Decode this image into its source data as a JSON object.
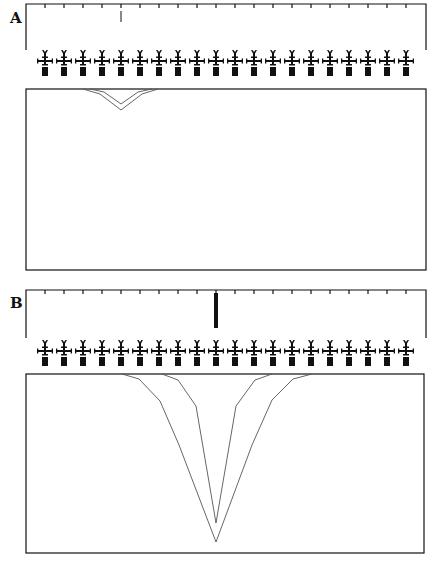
{
  "figure": {
    "colors": {
      "ink": "#111111",
      "line": "#555555",
      "background": "#ffffff"
    },
    "panels": [
      {
        "id": "A",
        "label": "A",
        "label_pos": [
          10,
          9
        ],
        "ruler": {
          "x0": 26,
          "x1": 426,
          "y": 4,
          "bracket_bottom": 50,
          "tick_start": 45,
          "tick_spacing": 19,
          "tick_count": 20,
          "tick_len": 4
        },
        "marker": {
          "x": 121,
          "y0": 11,
          "y1": 22,
          "width": 1,
          "label": "thin-marker"
        },
        "glyph_row": {
          "y_top": 50,
          "x_start": 45,
          "spacing": 19,
          "count": 20
        },
        "box": {
          "x": 26,
          "y": 89,
          "w": 400,
          "h": 181
        },
        "profiles": [
          {
            "name": "outer",
            "points": [
              [
                83,
                89
              ],
              [
                100,
                94
              ],
              [
                121,
                110
              ],
              [
                142,
                94
              ],
              [
                158,
                89
              ]
            ]
          },
          {
            "name": "inner",
            "points": [
              [
                90,
                89
              ],
              [
                104,
                92
              ],
              [
                121,
                104
              ],
              [
                138,
                92
              ],
              [
                152,
                89
              ]
            ]
          }
        ]
      },
      {
        "id": "B",
        "label": "B",
        "label_pos": [
          10,
          294
        ],
        "ruler": {
          "x0": 26,
          "x1": 426,
          "y": 290,
          "bracket_bottom": 338,
          "tick_start": 45,
          "tick_spacing": 19,
          "tick_count": 20,
          "tick_len": 4
        },
        "marker": {
          "x": 216,
          "y0": 293,
          "y1": 328,
          "width": 4,
          "label": "thick-marker"
        },
        "glyph_row": {
          "y_top": 340,
          "x_start": 45,
          "spacing": 19,
          "count": 20
        },
        "box": {
          "x": 26,
          "y": 374,
          "w": 398,
          "h": 179
        },
        "profiles": [
          {
            "name": "outer",
            "points": [
              [
                122,
                374
              ],
              [
                139,
                379
              ],
              [
                160,
                401
              ],
              [
                179,
                445
              ],
              [
                216,
                542
              ],
              [
                252,
                445
              ],
              [
                272,
                400
              ],
              [
                293,
                379
              ],
              [
                312,
                374
              ]
            ]
          },
          {
            "name": "inner",
            "points": [
              [
                162,
                374
              ],
              [
                178,
                380
              ],
              [
                196,
                406
              ],
              [
                216,
                523
              ],
              [
                236,
                406
              ],
              [
                255,
                380
              ],
              [
                272,
                374
              ]
            ]
          }
        ]
      }
    ]
  }
}
